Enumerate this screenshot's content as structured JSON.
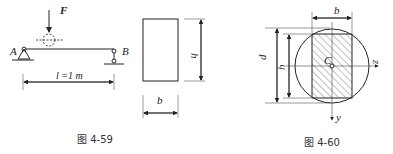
{
  "figure_4_59": {
    "caption": "图 4-59",
    "force_label": "F",
    "support_a": "A",
    "support_b": "B",
    "span_label": "l =1  m",
    "section_width": "b",
    "section_height": "h"
  },
  "figure_4_60": {
    "caption": "图 4-60",
    "width_label": "b",
    "diameter_label": "d",
    "height_label": "h",
    "centroid_label": "C",
    "z_axis": "z",
    "y_axis": "y"
  }
}
